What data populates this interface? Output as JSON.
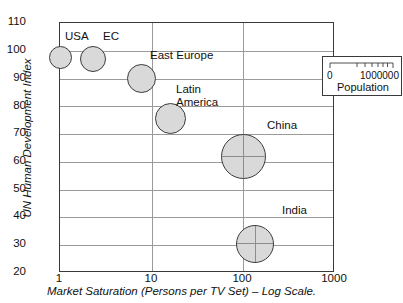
{
  "chart_data": {
    "type": "scatter",
    "title": "",
    "xlabel": "Market Saturation (Persons per TV Set) – Log Scale.",
    "ylabel": "UN Human Development Index",
    "xscale": "log",
    "xlim": [
      1,
      1000
    ],
    "ylim": [
      20,
      110
    ],
    "xticks": [
      "1",
      "10",
      "100",
      "1000"
    ],
    "yticks": [
      "20",
      "30",
      "40",
      "50",
      "60",
      "70",
      "80",
      "90",
      "100",
      "110"
    ],
    "grid": true,
    "size_encoding": "Population",
    "legend": {
      "position": "top-right",
      "title": "Population",
      "scale_min": "0",
      "scale_max": "1000000"
    },
    "points": [
      {
        "label": "USA",
        "x": 1.0,
        "y": 97.5,
        "size_px": 23
      },
      {
        "label": "EC",
        "x": 2.3,
        "y": 97.0,
        "size_px": 26
      },
      {
        "label": "East Europe",
        "x": 7.8,
        "y": 90.0,
        "size_px": 29
      },
      {
        "label": "Latin America",
        "x": 16.0,
        "y": 75.5,
        "size_px": 31
      },
      {
        "label": "China",
        "x": 100.0,
        "y": 62.0,
        "size_px": 45
      },
      {
        "label": "India",
        "x": 135.0,
        "y": 30.5,
        "size_px": 38
      }
    ]
  },
  "colors": {
    "bubble_fill": "#d9d9d9",
    "bubble_stroke": "#3c3c3c",
    "grid": "#9a9a9a",
    "frame": "#3a3a3a",
    "text": "#111111",
    "background": "#ffffff"
  }
}
